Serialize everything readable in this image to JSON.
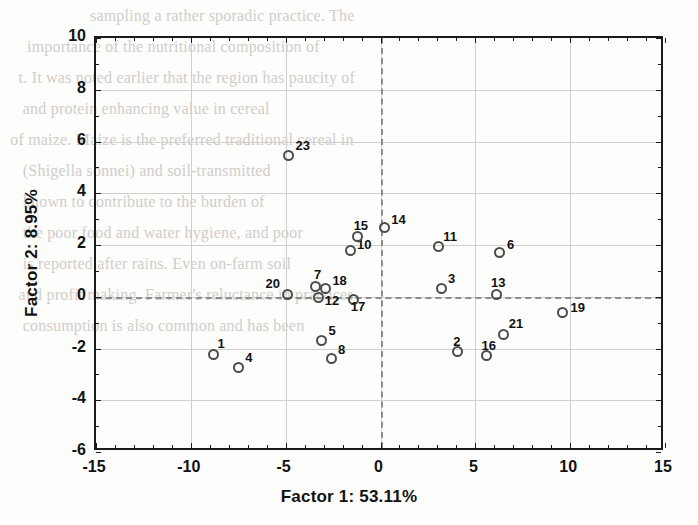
{
  "chart_data": {
    "type": "scatter",
    "title": "",
    "xlabel": "Factor 1: 53.11%",
    "ylabel": "Factor 2: 8.95%",
    "xlim": [
      -15,
      15
    ],
    "ylim": [
      -6,
      10
    ],
    "xticks": [
      -15,
      -10,
      -5,
      0,
      5,
      10,
      15
    ],
    "yticks": [
      -6,
      -4,
      -2,
      0,
      2,
      4,
      6,
      8,
      10
    ],
    "xticklabels": [
      "-15",
      "-10",
      "-5",
      "0",
      "5",
      "10",
      "15"
    ],
    "yticklabels": [
      "-6",
      "-4",
      "-2",
      "0",
      "2",
      "4",
      "6",
      "8",
      "10"
    ],
    "grid": true,
    "legend": "none",
    "reference_lines": [
      {
        "axis": "x",
        "value": 0,
        "style": "dashed"
      },
      {
        "axis": "y",
        "value": 0,
        "style": "dashed"
      }
    ],
    "marker": "open-circle",
    "marker_color": "#4c4c4c",
    "points": [
      {
        "label": "1",
        "x": -8.7,
        "y": -2.3,
        "lx": 4,
        "ly": -18
      },
      {
        "label": "2",
        "x": 4.15,
        "y": -2.2,
        "lx": -4,
        "ly": -18
      },
      {
        "label": "3",
        "x": 3.3,
        "y": 0.25,
        "lx": 7,
        "ly": -17
      },
      {
        "label": "4",
        "x": -7.4,
        "y": -2.8,
        "lx": 7,
        "ly": -17
      },
      {
        "label": "5",
        "x": -3.0,
        "y": -1.75,
        "lx": 7,
        "ly": -17
      },
      {
        "label": "6",
        "x": 6.4,
        "y": 1.65,
        "lx": 7,
        "ly": -15
      },
      {
        "label": "7",
        "x": -3.3,
        "y": 0.3,
        "lx": -2,
        "ly": -20
      },
      {
        "label": "8",
        "x": -2.5,
        "y": -2.45,
        "lx": 7,
        "ly": -16
      },
      {
        "label": "10",
        "x": -1.5,
        "y": 1.7,
        "lx": 7,
        "ly": -14
      },
      {
        "label": "11",
        "x": 3.15,
        "y": 1.85,
        "lx": 5,
        "ly": -18
      },
      {
        "label": "12",
        "x": -3.15,
        "y": -0.1,
        "lx": 6,
        "ly": -4
      },
      {
        "label": "13",
        "x": 6.2,
        "y": 0.0,
        "lx": -5,
        "ly": -20
      },
      {
        "label": "14",
        "x": 0.3,
        "y": 2.6,
        "lx": 7,
        "ly": -15
      },
      {
        "label": "15",
        "x": -1.1,
        "y": 2.25,
        "lx": -4,
        "ly": -19
      },
      {
        "label": "16",
        "x": 5.7,
        "y": -2.35,
        "lx": -5,
        "ly": -18
      },
      {
        "label": "17",
        "x": -1.3,
        "y": -0.2,
        "lx": -3,
        "ly": -1
      },
      {
        "label": "18",
        "x": -2.8,
        "y": 0.25,
        "lx": 7,
        "ly": -15
      },
      {
        "label": "19",
        "x": 9.7,
        "y": -0.7,
        "lx": 8,
        "ly": -13
      },
      {
        "label": "20",
        "x": -4.8,
        "y": 0.0,
        "lx": -22,
        "ly": -19
      },
      {
        "label": "21",
        "x": 6.6,
        "y": -1.55,
        "lx": 5,
        "ly": -19
      },
      {
        "label": "23",
        "x": -4.75,
        "y": 5.4,
        "lx": 7,
        "ly": -17
      }
    ]
  },
  "background_page_text": {
    "lines": [
      "                    sampling a rather sporadic practice. The",
      "",
      "     importance of the nutritional composition of",
      "   t. It was noted earlier that the region has paucity of",
      "",
      "    and protein enhancing value in cereal",
      " of maize. Maize is the preferred traditional cereal in",
      "",
      "    (Shigella sonnei) and soil-transmitted",
      "    known to contribute to the burden of",
      "",
      "    the poor food and water hygiene, and poor",
      "    is reported after rains. Even on-farm soil",
      "",
      "   and profit making. Farmer's reluctance in practices",
      "",
      "    consumption is also common and has been"
    ]
  }
}
